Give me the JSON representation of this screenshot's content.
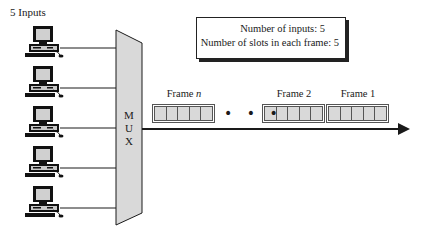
{
  "diagram": {
    "inputs_label": "5 Inputs",
    "input_count": 5,
    "inputs": [
      {
        "id": 1,
        "icon": "computer-icon"
      },
      {
        "id": 2,
        "icon": "computer-icon"
      },
      {
        "id": 3,
        "icon": "computer-icon"
      },
      {
        "id": 4,
        "icon": "computer-icon"
      },
      {
        "id": 5,
        "icon": "computer-icon"
      }
    ],
    "mux": {
      "letters": [
        "M",
        "U",
        "X"
      ],
      "fill": "#d9d9d9"
    },
    "info_box": {
      "line1": "Number of inputs: 5",
      "line2": "Number of slots in each frame: 5"
    },
    "frames": [
      {
        "label_prefix": "Frame ",
        "label_var": "n",
        "slots": 5
      },
      {
        "label": "Frame 2",
        "slots": 5
      },
      {
        "label": "Frame 1",
        "slots": 5
      }
    ],
    "ellipsis": "• • •",
    "colors": {
      "slot_fill": "#d9d9d9",
      "line": "#1a1a1a"
    }
  }
}
